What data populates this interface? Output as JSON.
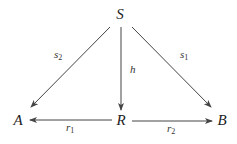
{
  "diagram": {
    "type": "commutative-diagram",
    "nodes": [
      {
        "id": "S",
        "label": "S"
      },
      {
        "id": "A",
        "label": "A"
      },
      {
        "id": "R",
        "label": "R"
      },
      {
        "id": "B",
        "label": "B"
      }
    ],
    "edges": [
      {
        "from": "S",
        "to": "A",
        "label": "s",
        "sub": "2"
      },
      {
        "from": "S",
        "to": "R",
        "label": "h",
        "sub": ""
      },
      {
        "from": "S",
        "to": "B",
        "label": "s",
        "sub": "1"
      },
      {
        "from": "R",
        "to": "A",
        "label": "r",
        "sub": "1"
      },
      {
        "from": "R",
        "to": "B",
        "label": "r",
        "sub": "2"
      }
    ]
  },
  "colors": {
    "stroke": "#444444",
    "text": "#222222",
    "background": "#ffffff"
  }
}
